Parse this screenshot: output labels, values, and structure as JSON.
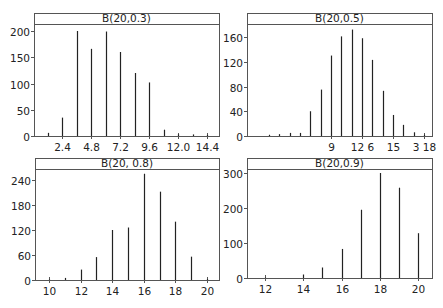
{
  "chart_data": [
    {
      "type": "bar",
      "title": "B(20,0.3)",
      "xlabel": "",
      "ylabel": "",
      "x": [
        1.2,
        2.4,
        3.6,
        4.8,
        6.0,
        7.2,
        8.4,
        9.6,
        10.8,
        12.0,
        13.2,
        14.4
      ],
      "values": [
        6,
        35,
        200,
        166,
        199,
        160,
        120,
        102,
        12,
        3,
        3,
        2
      ],
      "xticks": [
        2.4,
        4.8,
        7.2,
        9.6,
        12.0,
        14.4
      ],
      "xtick_labels": [
        "2.4",
        "4.8",
        "7.2",
        "9.6",
        "12.0",
        "14.4"
      ],
      "yticks": [
        0,
        50,
        100,
        150,
        200
      ],
      "ytick_labels": [
        "0",
        "50",
        "100",
        "150",
        "200"
      ],
      "ylim": [
        0,
        210
      ],
      "grid": false
    },
    {
      "type": "bar",
      "title": "B(20,0.5)",
      "xlabel": "",
      "ylabel": "",
      "x": [
        3,
        4,
        5,
        6,
        7,
        8,
        9,
        10,
        11,
        12,
        13,
        14,
        15,
        16,
        17,
        18
      ],
      "values": [
        2,
        3,
        5,
        5,
        40,
        75,
        130,
        161,
        172,
        158,
        123,
        73,
        34,
        18,
        6,
        2
      ],
      "xticks": [
        9,
        12,
        15,
        18
      ],
      "xtick_labels": [
        "9",
        "12 6",
        "15",
        "3 18"
      ],
      "yticks": [
        0,
        40,
        80,
        120,
        160
      ],
      "ytick_labels": [
        "0",
        "40",
        "80",
        "120",
        "160"
      ],
      "ylim": [
        0,
        180
      ],
      "grid": false
    },
    {
      "type": "bar",
      "title": "B(20, 0.8)",
      "xlabel": "",
      "ylabel": "",
      "x": [
        10,
        11,
        12,
        13,
        14,
        15,
        16,
        17,
        18,
        19,
        20
      ],
      "values": [
        1,
        5,
        25,
        55,
        120,
        126,
        255,
        212,
        140,
        56,
        2
      ],
      "xticks": [
        10,
        12,
        14,
        16,
        18,
        20
      ],
      "xtick_labels": [
        "10",
        "12",
        "14",
        "16",
        "18",
        "20"
      ],
      "yticks": [
        0,
        60,
        120,
        180,
        240
      ],
      "ytick_labels": [
        "0",
        "60",
        "120",
        "180",
        "240"
      ],
      "ylim": [
        0,
        265
      ],
      "grid": false
    },
    {
      "type": "bar",
      "title": "B(20,0.9)",
      "xlabel": "",
      "ylabel": "",
      "x": [
        12,
        14,
        15,
        16,
        17,
        18,
        19,
        20
      ],
      "values": [
        1,
        10,
        30,
        83,
        195,
        300,
        258,
        128
      ],
      "xticks": [
        12,
        14,
        16,
        18,
        20
      ],
      "xtick_labels": [
        "12",
        "14",
        "16",
        "18",
        "20"
      ],
      "yticks": [
        0,
        100,
        200,
        300
      ],
      "ytick_labels": [
        "0",
        "100",
        "200",
        "300"
      ],
      "ylim": [
        0,
        315
      ],
      "grid": false
    }
  ]
}
